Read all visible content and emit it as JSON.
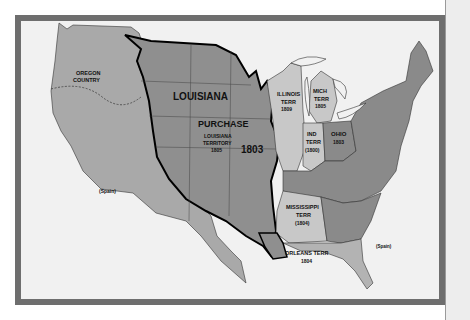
{
  "map": {
    "title": "Louisiana Purchase 1803",
    "colors": {
      "frame": "#6e6e6e",
      "background": "#f1f1f1",
      "purchase": "#8f8f8f",
      "west": "#a9a9a9",
      "territories_light": "#c8c8c8",
      "states_dark": "#8a8a8a",
      "spanish_florida": "#b3b3b3",
      "boundary": "#000000"
    },
    "labels": {
      "oregon_line1": "OREGON",
      "oregon_line2": "COUNTRY",
      "louisiana": "LOUISIANA",
      "purchase": "PURCHASE",
      "lt_line1": "LOUISIANA",
      "lt_line2": "TERRITORY",
      "lt_year": "1805",
      "year_1803": "1803",
      "illinois_line1": "ILLINOIS",
      "illinois_line2": "TERR",
      "illinois_year": "1809",
      "mich_line1": "MICH",
      "mich_line2": "TERR",
      "mich_year": "1805",
      "ind_line1": "IND",
      "ind_line2": "TERR",
      "ind_year": "(1800)",
      "ohio": "OHIO",
      "ohio_year": "1803",
      "mississippi_line1": "MISSISSIPPI",
      "mississippi_line2": "TERR",
      "mississippi_year": "(1804)",
      "orleans": "ORLEANS TERR",
      "orleans_year": "1804",
      "spain_west": "(Spain)",
      "spain_florida": "(Spain)"
    }
  }
}
